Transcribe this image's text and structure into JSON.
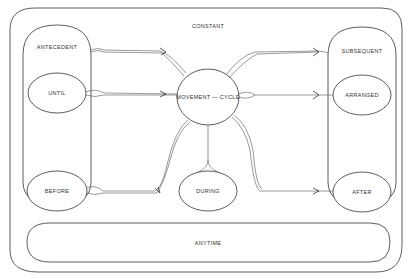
{
  "diagram": {
    "outer_label": "CONSTANT",
    "center": "MOVEMENT — CYCLE",
    "left_group": {
      "top": "ANTECEDENT",
      "nodes": [
        "UNTIL",
        "BEFORE"
      ]
    },
    "right_group": {
      "top": "SUBSEQUENT",
      "nodes": [
        "ARRANGED",
        "AFTER"
      ]
    },
    "bottom_center": "DURING",
    "bottom_band": "ANYTIME"
  },
  "edges": [
    {
      "from": "ANTECEDENT",
      "to": "MOVEMENT — CYCLE"
    },
    {
      "from": "UNTIL",
      "to": "MOVEMENT — CYCLE"
    },
    {
      "from": "BEFORE",
      "to": "MOVEMENT — CYCLE"
    },
    {
      "from": "MOVEMENT — CYCLE",
      "to": "DURING"
    },
    {
      "from": "MOVEMENT — CYCLE",
      "to": "SUBSEQUENT"
    },
    {
      "from": "MOVEMENT — CYCLE",
      "to": "ARRANGED"
    },
    {
      "from": "MOVEMENT — CYCLE",
      "to": "AFTER"
    }
  ]
}
